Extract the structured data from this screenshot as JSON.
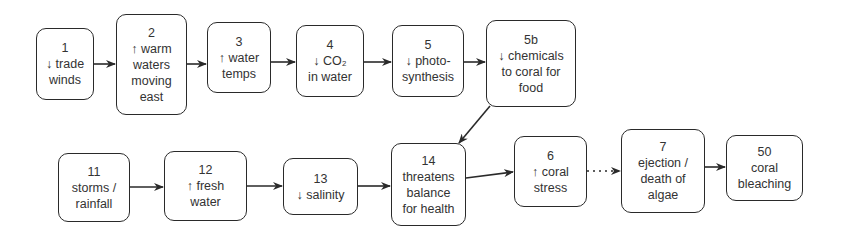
{
  "diagram": {
    "nodes": [
      {
        "id": "1",
        "lines": [
          "1",
          "↓ trade",
          "winds"
        ]
      },
      {
        "id": "2",
        "lines": [
          "2",
          "↑ warm",
          "waters",
          "moving",
          "east"
        ]
      },
      {
        "id": "3",
        "lines": [
          "3",
          "↑ water",
          "temps"
        ]
      },
      {
        "id": "4",
        "lines": [
          "4",
          "↓ CO₂",
          "in water"
        ]
      },
      {
        "id": "5",
        "lines": [
          "5",
          "↓ photo-",
          "synthesis"
        ]
      },
      {
        "id": "5b",
        "lines": [
          "5b",
          "↓ chemicals",
          "to coral for",
          "food"
        ]
      },
      {
        "id": "11",
        "lines": [
          "11",
          "storms /",
          "rainfall"
        ]
      },
      {
        "id": "12",
        "lines": [
          "12",
          "↑ fresh",
          "water"
        ]
      },
      {
        "id": "13",
        "lines": [
          "13",
          "↓  salinity"
        ]
      },
      {
        "id": "14",
        "lines": [
          "14",
          "threatens",
          "balance",
          "for health"
        ]
      },
      {
        "id": "6",
        "lines": [
          "6",
          "↑ coral",
          "stress"
        ]
      },
      {
        "id": "7",
        "lines": [
          "7",
          "ejection /",
          "death of",
          "algae"
        ]
      },
      {
        "id": "50",
        "lines": [
          "50",
          "coral",
          "bleaching"
        ]
      }
    ],
    "edges": [
      {
        "from": "1",
        "to": "2",
        "style": "solid"
      },
      {
        "from": "2",
        "to": "3",
        "style": "solid"
      },
      {
        "from": "3",
        "to": "4",
        "style": "solid"
      },
      {
        "from": "4",
        "to": "5",
        "style": "solid"
      },
      {
        "from": "5",
        "to": "5b",
        "style": "solid"
      },
      {
        "from": "5b",
        "to": "14",
        "style": "solid"
      },
      {
        "from": "11",
        "to": "12",
        "style": "solid"
      },
      {
        "from": "12",
        "to": "13",
        "style": "solid"
      },
      {
        "from": "13",
        "to": "14",
        "style": "solid"
      },
      {
        "from": "14",
        "to": "6",
        "style": "solid"
      },
      {
        "from": "6",
        "to": "7",
        "style": "dotted"
      },
      {
        "from": "7",
        "to": "50",
        "style": "solid"
      }
    ],
    "colors": {
      "stroke": "#2a2a2a",
      "text": "#333333",
      "background": "#ffffff"
    }
  }
}
